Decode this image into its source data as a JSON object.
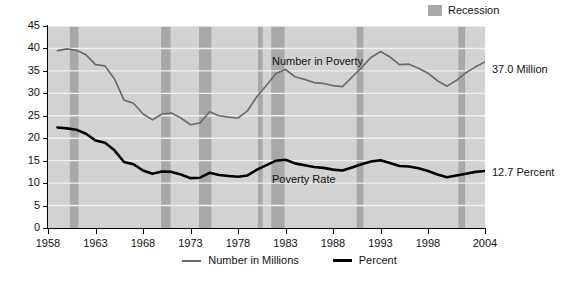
{
  "recession_key": {
    "label": "Recession",
    "swatch_color": "#a8a8a8"
  },
  "annotations": {
    "number_series_label": "Number in Poverty",
    "rate_series_label": "Poverty Rate",
    "end_value_number": "37.0 Million",
    "end_value_rate": "12.7 Percent"
  },
  "legend": {
    "items": [
      {
        "label": "Number in Millions",
        "color": "#6b6b6b"
      },
      {
        "label": "Percent",
        "color": "#000000"
      }
    ]
  },
  "chart_data": {
    "type": "line",
    "title": "",
    "subtitle": "",
    "xlabel": "",
    "ylabel": "",
    "xlim": [
      1958,
      2004
    ],
    "ylim": [
      0,
      45
    ],
    "grid": true,
    "grid_color": "#f0f0f0",
    "plot_background": "#d2d2d2",
    "legend_position": "bottom-center",
    "y_ticks": [
      0,
      5,
      10,
      15,
      20,
      25,
      30,
      35,
      40,
      45
    ],
    "x_ticks": [
      1958,
      1963,
      1968,
      1973,
      1978,
      1983,
      1988,
      1993,
      1998,
      2004
    ],
    "x_tick_labels": [
      "1958",
      "1963",
      "1968",
      "1973",
      "1978",
      "1983",
      "1988",
      "1993",
      "1998",
      "2004"
    ],
    "x": [
      1959,
      1960,
      1961,
      1962,
      1963,
      1964,
      1965,
      1966,
      1967,
      1968,
      1969,
      1970,
      1971,
      1972,
      1973,
      1974,
      1975,
      1976,
      1977,
      1978,
      1979,
      1980,
      1981,
      1982,
      1983,
      1984,
      1985,
      1986,
      1987,
      1988,
      1989,
      1990,
      1991,
      1992,
      1993,
      1994,
      1995,
      1996,
      1997,
      1998,
      1999,
      2000,
      2001,
      2002,
      2003,
      2004
    ],
    "series": [
      {
        "name": "Number in Millions",
        "color": "#6b6b6b",
        "units": "millions",
        "values": [
          39.5,
          39.9,
          39.6,
          38.6,
          36.4,
          36.1,
          33.2,
          28.5,
          27.8,
          25.4,
          24.1,
          25.4,
          25.6,
          24.5,
          23.0,
          23.4,
          25.9,
          25.0,
          24.7,
          24.5,
          26.1,
          29.3,
          31.8,
          34.4,
          35.3,
          33.7,
          33.1,
          32.4,
          32.2,
          31.7,
          31.5,
          33.6,
          35.7,
          38.0,
          39.3,
          38.1,
          36.4,
          36.5,
          35.6,
          34.5,
          32.8,
          31.6,
          32.9,
          34.6,
          35.9,
          37.0
        ]
      },
      {
        "name": "Percent",
        "color": "#000000",
        "units": "percent",
        "values": [
          22.4,
          22.2,
          21.9,
          21.0,
          19.5,
          19.0,
          17.3,
          14.7,
          14.2,
          12.8,
          12.1,
          12.6,
          12.5,
          11.9,
          11.1,
          11.2,
          12.3,
          11.8,
          11.6,
          11.4,
          11.7,
          13.0,
          14.0,
          15.0,
          15.2,
          14.4,
          14.0,
          13.6,
          13.4,
          13.0,
          12.8,
          13.5,
          14.2,
          14.8,
          15.1,
          14.5,
          13.8,
          13.7,
          13.3,
          12.7,
          11.9,
          11.3,
          11.7,
          12.1,
          12.5,
          12.7
        ]
      }
    ],
    "recession_bands": [
      {
        "start": 1960.3,
        "end": 1961.2
      },
      {
        "start": 1969.9,
        "end": 1970.9
      },
      {
        "start": 1973.9,
        "end": 1975.2
      },
      {
        "start": 1980.1,
        "end": 1980.6
      },
      {
        "start": 1981.5,
        "end": 1982.9
      },
      {
        "start": 1990.5,
        "end": 1991.2
      },
      {
        "start": 2001.2,
        "end": 2001.9
      }
    ]
  }
}
